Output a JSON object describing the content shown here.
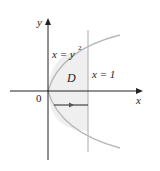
{
  "diagram": {
    "axes": {
      "x_label": "x",
      "y_label": "y",
      "origin_label": "0"
    },
    "curves": {
      "parabola_label": "x = y",
      "parabola_exponent": "2",
      "line_label": "x = 1"
    },
    "region_label": "D",
    "colors": {
      "curve": "#b8b8b8",
      "axis": "#222222",
      "region": "#efefef"
    }
  }
}
